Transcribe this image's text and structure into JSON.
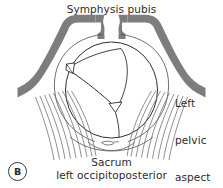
{
  "figure": {
    "panel_letter": "B",
    "background_color": "#ffffff",
    "bone_color": "#7d7d7d",
    "line_color": "#3a3a3a",
    "text_color": "#2b2b2b"
  },
  "labels": {
    "top": "Symphysis pubis",
    "right_line1": "Left",
    "right_line2": "pelvic",
    "right_line3": "aspect",
    "bottom_line1": "Sacrum",
    "bottom_line2": "left occipitoposterior"
  },
  "anatomy": {
    "pelvic_bone_name": "pelvic-brim",
    "symphysis_name": "symphysis-pubis-gap",
    "fetal_head_name": "fetal-skull-outline",
    "sagittal_suture_name": "sagittal-suture",
    "anterior_fontanelle_name": "anterior-fontanelle",
    "posterior_fontanelle_name": "posterior-fontanelle",
    "sacrum_name": "sacrum-outline",
    "ligaments_left_name": "sacrotuberous-ligaments-left",
    "ligaments_right_name": "sacrotuberous-ligaments-right"
  }
}
